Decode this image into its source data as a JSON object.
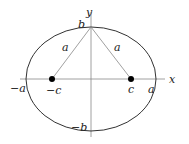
{
  "diagram": {
    "type": "ellipse-foci",
    "colors": {
      "stroke": "#333333",
      "line": "#888888",
      "text": "#222222"
    },
    "axes": {
      "x_label": "x",
      "y_label": "y"
    },
    "labels": {
      "neg_a": "−a",
      "pos_a": "a",
      "neg_c": "−c",
      "pos_c": "c",
      "pos_b": "b",
      "neg_b": "−b",
      "left_segment": "a",
      "right_segment": "a"
    }
  }
}
